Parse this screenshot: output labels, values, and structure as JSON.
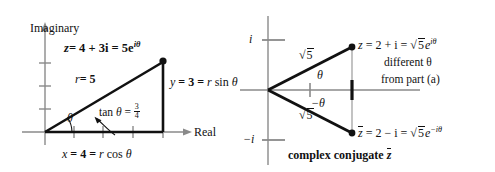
{
  "figure": {
    "type": "diagram",
    "colors": {
      "ink": "#111111",
      "axis": "#8a8a8a",
      "background": "#ffffff"
    }
  },
  "panel_a": {
    "axis_imaginary_label": "Imaginary",
    "axis_real_label": "Real",
    "point_label": {
      "z": "z",
      "eq1": "= 4 + 3i",
      "eq2": "= 5e",
      "exp": "iθ"
    },
    "radius_label": {
      "r": "r",
      "eq": "= 5"
    },
    "theta_label": "θ",
    "tan_label": {
      "tan": "tan",
      "theta": "θ",
      "eq": "=",
      "num": "3",
      "den": "4"
    },
    "vertical_label": {
      "y": "y",
      "eq": "= 3 =",
      "r": "r",
      "fn": "sin",
      "theta": "θ"
    },
    "horizontal_label": {
      "x": "x",
      "eq": "= 4 =",
      "r": "r",
      "fn": "cos",
      "theta": "θ"
    },
    "geometry": {
      "origin": [
        45,
        132
      ],
      "point": [
        163,
        62
      ],
      "x_value": 4,
      "y_value": 3,
      "r_value": 5,
      "x_ticks": 4,
      "y_ticks": 3
    }
  },
  "panel_b": {
    "axis_tick_i": "i",
    "axis_tick_neg_i": "−i",
    "z_label": {
      "z": "z",
      "eq1": "= 2 + i",
      "eq2": "=",
      "root": "5",
      "e": "e",
      "exp": "iθ"
    },
    "note_line1": "different θ",
    "note_line2": "from part (a)",
    "zbar_label": {
      "zbar": "z",
      "eq1": "= 2 − i",
      "eq2": "=",
      "root": "5",
      "e": "e",
      "exp": "−iθ"
    },
    "upper_radius_label": "5",
    "lower_radius_label": "5",
    "theta_upper": "θ",
    "theta_lower": "−θ",
    "caption": "complex conjugate",
    "caption_symbol": "z",
    "geometry": {
      "origin": [
        268,
        90
      ],
      "z_point": [
        352,
        47
      ],
      "zbar_point": [
        352,
        133
      ],
      "real_value": 2,
      "imag_value": 1,
      "modulus": "√5"
    }
  }
}
